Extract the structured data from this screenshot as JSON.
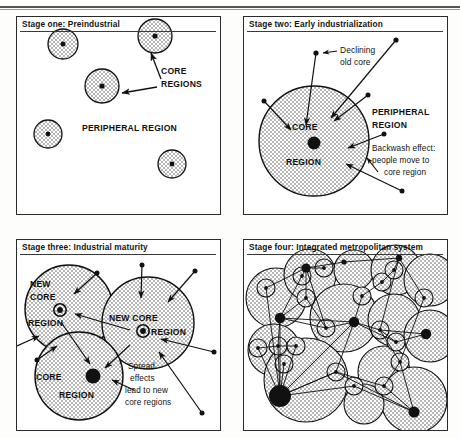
{
  "figure": {
    "name": "core-periphery-model-four-stages",
    "panels": [
      {
        "id": "stage-one",
        "title": "Stage one: Preindustrial",
        "labels": [
          {
            "name": "core-regions-label",
            "text": "CORE",
            "text2": "REGIONS"
          },
          {
            "name": "peripheral-region-label",
            "text": "PERIPHERAL REGION"
          }
        ]
      },
      {
        "id": "stage-two",
        "title": "Stage two: Early industrialization",
        "labels": [
          {
            "name": "declining-old-core-label",
            "line1": "Declining",
            "line2": "old core"
          },
          {
            "name": "peripheral-region-label",
            "line1": "PERIPHERAL",
            "line2": "REGION"
          },
          {
            "name": "core-region-label",
            "line1": "CORE",
            "line2": "REGION"
          },
          {
            "name": "backwash-effect-label",
            "line1": "Backwash effect:",
            "line2": "people move to",
            "line3": "core region"
          }
        ]
      },
      {
        "id": "stage-three",
        "title": "Stage three: Industrial maturity",
        "labels": [
          {
            "name": "new-core-region-left-label",
            "line1": "NEW",
            "line2": "CORE",
            "line3": "REGION"
          },
          {
            "name": "new-core-region-right-label",
            "line1": "NEW CORE",
            "line2": "REGION"
          },
          {
            "name": "core-region-label",
            "line1": "CORE",
            "line2": "REGION"
          },
          {
            "name": "spread-effects-label",
            "line1": "Spread",
            "line2": "effects",
            "line3": "lead to new",
            "line4": "core regions"
          }
        ]
      },
      {
        "id": "stage-four",
        "title": "Stage four: Integrated metropolitan system",
        "labels": []
      }
    ]
  },
  "colors": {
    "ink": "#111111",
    "panel_border": "#2a2a2a",
    "stipple": "#4a4a4a",
    "paper": "#ffffff"
  }
}
